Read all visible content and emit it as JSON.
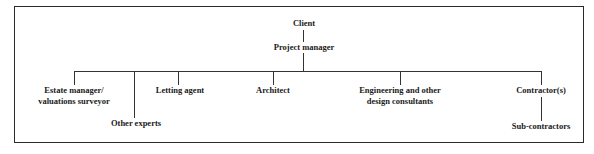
{
  "diagram": {
    "type": "organization-chart",
    "root": {
      "label": "Client",
      "child": {
        "label": "Project manager",
        "children": [
          {
            "label_line1": "Estate manager/",
            "label_line2": "valuations surveyor"
          },
          {
            "label": "Other experts"
          },
          {
            "label": "Letting agent"
          },
          {
            "label": "Architect"
          },
          {
            "label_line1": "Engineering and other",
            "label_line2": "design consultants"
          },
          {
            "label": "Contractor(s)",
            "child": {
              "label": "Sub-contractors"
            }
          }
        ]
      }
    }
  }
}
